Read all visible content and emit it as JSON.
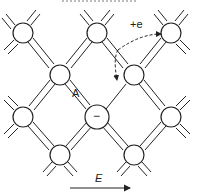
{
  "diagram": {
    "title_partial": "",
    "labels": {
      "electron": "+e",
      "acceptor": "A",
      "acceptor_charge": "−",
      "field": "E"
    },
    "atoms": [
      {
        "id": "a1",
        "x": 23,
        "y": 33
      },
      {
        "id": "a2",
        "x": 97,
        "y": 33
      },
      {
        "id": "a3",
        "x": 171,
        "y": 33
      },
      {
        "id": "a4",
        "x": 60,
        "y": 75
      },
      {
        "id": "a5",
        "x": 134,
        "y": 75
      },
      {
        "id": "a6",
        "x": 23,
        "y": 117
      },
      {
        "id": "a7",
        "x": 97,
        "y": 117,
        "label": "acceptor"
      },
      {
        "id": "a8",
        "x": 171,
        "y": 117
      },
      {
        "id": "a9",
        "x": 60,
        "y": 155
      },
      {
        "id": "a10",
        "x": 134,
        "y": 155
      }
    ],
    "colors": {
      "line": "#222222",
      "background": "#ffffff"
    }
  }
}
